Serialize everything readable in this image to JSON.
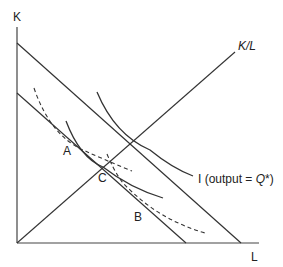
{
  "axes": {
    "y_label": "K",
    "x_label": "L"
  },
  "ray": {
    "label": "K/L"
  },
  "isoquant": {
    "label_prefix": "I (output = ",
    "label_q": "Q",
    "label_star": "*",
    "label_suffix": ")"
  },
  "points": {
    "a": "A",
    "b": "B",
    "c": "C"
  },
  "colors": {
    "line": "#333333",
    "background": "#ffffff"
  }
}
